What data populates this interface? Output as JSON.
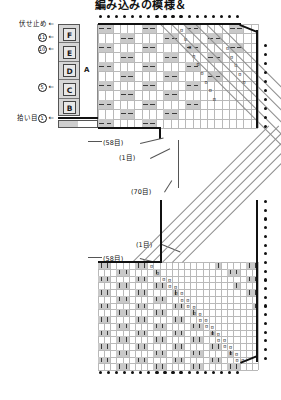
{
  "title": "編み込みの模様＆",
  "sidebar": {
    "top_label": {
      "text": "伏せ止め",
      "arrow": "←"
    },
    "row_markers": [
      {
        "number": "11",
        "arrow": "←"
      },
      {
        "number": "10",
        "arrow": "←"
      }
    ],
    "mid_marker": {
      "number": "5",
      "arrow": "←"
    },
    "bottom_label": {
      "text": "拾い目",
      "number": "1",
      "arrow": "←"
    },
    "section_letters": [
      "F",
      "E",
      "D",
      "C",
      "B"
    ],
    "section_group_label": "A"
  },
  "callouts": {
    "upper_left_stitches": "(58目)",
    "upper_one_stitch": "(1目)",
    "middle_stitches": "(70目)",
    "lower_one_stitch": "(1目)",
    "lower_left_stitches": "(58目)"
  },
  "symbols": {
    "purl_dash": "—",
    "knit_bar": "|",
    "decrease": "ʊ",
    "bind_off_dot": "•"
  },
  "colors": {
    "shaded_cell": "#c9c9c9",
    "grid_line": "#b9b9b9",
    "outline": "#111111",
    "section_column": "#d6d6d6"
  },
  "chart_data": {
    "type": "heatmap",
    "title": "編み込みの模様＆",
    "xlabel": "",
    "ylabel": "",
    "grid": true,
    "legend": "none",
    "note": "Japanese knitting stitch chart: shaded cells = colorwork/purl blocks, dash = purl stitch, vertical bar = knit stitch, diagonal lattice = decrease lines, dotted edges = bind-off rows.",
    "panels": [
      {
        "name": "upper-chart",
        "columns": 22,
        "rows": 11,
        "stitch_count": "(58目)",
        "shaded_pattern": "staggered 2x1 blocks on alternating rows"
      },
      {
        "name": "lower-chart",
        "columns": 26,
        "rows": 16,
        "stitch_count": "(70目)",
        "shaded_pattern": "staggered 2x1 blocks on alternating rows"
      }
    ],
    "categories": [
      "A",
      "B",
      "C",
      "D",
      "E",
      "F"
    ],
    "values": [
      1,
      5,
      10,
      11,
      58,
      70
    ]
  }
}
